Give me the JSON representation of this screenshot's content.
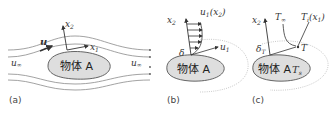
{
  "panels": {
    "a": {
      "caption": "(a)",
      "body_label": "物体 A",
      "u_label": "u",
      "x1_label": "x",
      "x1_sub": "1",
      "x2_label": "x",
      "x2_sub": "2",
      "u_inf_left": "u",
      "u_inf_left_sub": "∞",
      "u_inf_right": "u",
      "u_inf_right_sub": "∞"
    },
    "b": {
      "caption": "(b)",
      "body_label": "物体 A",
      "x2_label": "x",
      "x2_sub": "2",
      "profile_label": "u",
      "profile_sub": "1",
      "profile_arg": "(x",
      "profile_arg_sub": "2",
      "profile_arg_close": ")",
      "delta_label": "δ",
      "u1_label": "u",
      "u1_sub": "1"
    },
    "c": {
      "caption": "(c)",
      "body_label": "物体 A",
      "surface_temp": "T",
      "surface_temp_sub": "s",
      "x2_label": "x",
      "x2_sub": "2",
      "t_inf": "T",
      "t_inf_sub": "∞",
      "t_profile": "T",
      "t_profile_sub": "i",
      "t_profile_arg": "(x",
      "t_profile_arg_sub": "1",
      "t_profile_arg_close": ")",
      "delta_label": "δ",
      "delta_sub": "T",
      "t_label": "T"
    }
  },
  "colors": {
    "body_fill": "#dedede",
    "body_stroke": "#555555",
    "line": "#444444",
    "streamline": "#888888",
    "dotted": "#bbbbbb"
  }
}
